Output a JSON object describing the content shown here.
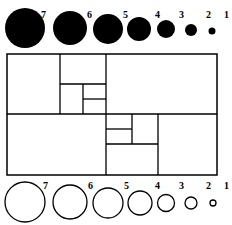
{
  "colors": {
    "ink": "#000000",
    "paper": "#ffffff"
  },
  "filled_circles": [
    {
      "label": "7",
      "cx": 25,
      "cy": 28,
      "r": 20,
      "lx": 41,
      "ly": 18
    },
    {
      "label": "6",
      "cx": 70,
      "cy": 28,
      "r": 17,
      "lx": 87,
      "ly": 18
    },
    {
      "label": "5",
      "cx": 108,
      "cy": 29,
      "r": 15,
      "lx": 123,
      "ly": 18
    },
    {
      "label": "4",
      "cx": 139,
      "cy": 29,
      "r": 12,
      "lx": 155,
      "ly": 18
    },
    {
      "label": "3",
      "cx": 166,
      "cy": 29,
      "r": 9,
      "lx": 179,
      "ly": 18
    },
    {
      "label": "2",
      "cx": 191,
      "cy": 30,
      "r": 6,
      "lx": 206,
      "ly": 18
    },
    {
      "label": "1",
      "cx": 212,
      "cy": 31,
      "r": 3.5,
      "lx": 224,
      "ly": 18
    }
  ],
  "outline_circles": [
    {
      "label": "7",
      "cx": 25,
      "cy": 202,
      "r": 20,
      "lx": 43,
      "ly": 189
    },
    {
      "label": "6",
      "cx": 70,
      "cy": 202,
      "r": 17,
      "lx": 88,
      "ly": 189
    },
    {
      "label": "5",
      "cx": 108,
      "cy": 203,
      "r": 15,
      "lx": 124,
      "ly": 189
    },
    {
      "label": "4",
      "cx": 140,
      "cy": 203,
      "r": 12,
      "lx": 155,
      "ly": 189
    },
    {
      "label": "3",
      "cx": 166,
      "cy": 203,
      "r": 8.5,
      "lx": 179,
      "ly": 189
    },
    {
      "label": "2",
      "cx": 191,
      "cy": 203,
      "r": 6,
      "lx": 206,
      "ly": 189
    },
    {
      "label": "1",
      "cx": 213,
      "cy": 203,
      "r": 3,
      "lx": 224,
      "ly": 189
    }
  ],
  "grid": {
    "outer": {
      "x": 7,
      "y": 54,
      "w": 210,
      "h": 121
    },
    "lines": [
      [
        7,
        114,
        217,
        114
      ],
      [
        60,
        54,
        60,
        114
      ],
      [
        106,
        54,
        106,
        175
      ],
      [
        60,
        84,
        106,
        84
      ],
      [
        83,
        84,
        83,
        114
      ],
      [
        83,
        99,
        106,
        99
      ],
      [
        158,
        114,
        158,
        175
      ],
      [
        106,
        144,
        158,
        144
      ],
      [
        132,
        114,
        132,
        144
      ],
      [
        106,
        129,
        132,
        129
      ]
    ]
  }
}
